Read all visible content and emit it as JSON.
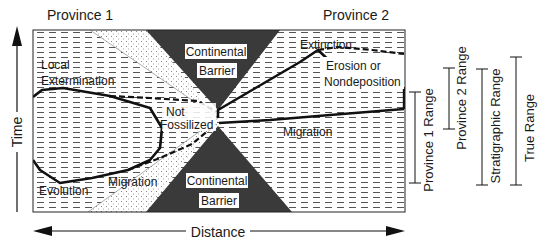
{
  "provinces": {
    "left": "Province 1",
    "right": "Province 2"
  },
  "axes": {
    "time": "Time",
    "distance": "Distance"
  },
  "barrier": {
    "top_line1": "Continental",
    "top_line2": "Barrier",
    "bottom_line1": "Continental",
    "bottom_line2": "Barrier"
  },
  "regions": {
    "local_line1": "Local",
    "local_line2": "Extermination",
    "not_line1": "Not",
    "not_line2": "Fossilized",
    "evolution": "Evolution",
    "migration_left": "Migration",
    "migration_right": "Migration",
    "extinction": "Extinction",
    "erosion_line1": "Erosion or",
    "erosion_line2": "Nondeposition"
  },
  "ranges": {
    "province1": "Province 1 Range",
    "province2": "Province 2 Range",
    "stratigraphic": "Stratigraphic Range",
    "true": "True Range"
  },
  "colors": {
    "barrier": "#3a3a3a",
    "line": "#111111",
    "hatch": "#555555",
    "dots": "#777777",
    "background": "#ffffff"
  }
}
